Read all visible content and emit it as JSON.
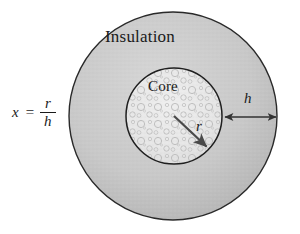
{
  "figure": {
    "type": "concentric-circle-cross-section",
    "labels": {
      "insulation": "Insulation",
      "core": "Core",
      "radius_symbol": "r",
      "thickness_symbol": "h"
    },
    "formula": {
      "variable": "x",
      "equals": "=",
      "numerator": "r",
      "denominator": "h"
    },
    "colors": {
      "insulation_fill": "#c9c9c9",
      "core_fill": "#e9e9e9",
      "outline": "#1a1a1a",
      "background": "#ffffff",
      "arrow": "#4a4a4a"
    },
    "geometry": {
      "center_x": 173,
      "center_y": 116,
      "outer_radius": 104,
      "inner_radius": 48,
      "radius_arrow_from": [
        174,
        116
      ],
      "radius_arrow_to": [
        208,
        148
      ],
      "thickness_arrow_from": [
        224,
        117
      ],
      "thickness_arrow_to": [
        277,
        117
      ]
    }
  }
}
